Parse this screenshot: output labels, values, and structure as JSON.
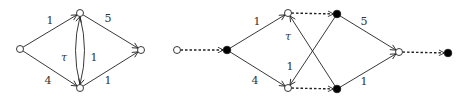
{
  "diagrams": [
    {
      "name": "left-graph",
      "nodes": [
        {
          "id": "s",
          "x": 20,
          "y": 49,
          "fill": "white"
        },
        {
          "id": "t",
          "x": 80,
          "y": 13,
          "fill": "white"
        },
        {
          "id": "b",
          "x": 80,
          "y": 88,
          "fill": "white"
        },
        {
          "id": "k",
          "x": 141,
          "y": 50,
          "fill": "white"
        }
      ],
      "edges": [
        {
          "from": "s",
          "to": "t",
          "label": "1",
          "lx": 50,
          "ly": 24
        },
        {
          "from": "s",
          "to": "b",
          "label": "4",
          "lx": 48,
          "ly": 84
        },
        {
          "from": "t",
          "to": "k",
          "label": "5",
          "lx": 108,
          "ly": 22
        },
        {
          "from": "b",
          "to": "k",
          "label": "1",
          "lx": 108,
          "ly": 84
        },
        {
          "from": "t",
          "to": "b",
          "label": "1",
          "lx": 94,
          "ly": 61,
          "curve": "right"
        },
        {
          "from": "b",
          "to": "t",
          "label": "τ",
          "lx": 64,
          "ly": 61,
          "curve": "left"
        }
      ]
    },
    {
      "name": "right-graph",
      "nodes": [
        {
          "id": "a",
          "x": 177,
          "y": 50,
          "fill": "white"
        },
        {
          "id": "c",
          "x": 227,
          "y": 50,
          "fill": "black"
        },
        {
          "id": "t",
          "x": 288,
          "y": 13,
          "fill": "white"
        },
        {
          "id": "b",
          "x": 288,
          "y": 88,
          "fill": "white"
        },
        {
          "id": "tb",
          "x": 337,
          "y": 14,
          "fill": "black"
        },
        {
          "id": "bb",
          "x": 337,
          "y": 89,
          "fill": "black"
        },
        {
          "id": "k",
          "x": 399,
          "y": 52,
          "fill": "white"
        },
        {
          "id": "e",
          "x": 448,
          "y": 53,
          "fill": "black"
        }
      ],
      "edges": [
        {
          "from": "a",
          "to": "c",
          "dashed": true
        },
        {
          "from": "c",
          "to": "t",
          "label": "1",
          "lx": 257,
          "ly": 25
        },
        {
          "from": "c",
          "to": "b",
          "label": "4",
          "lx": 255,
          "ly": 84
        },
        {
          "from": "t",
          "to": "tb",
          "dashed": true
        },
        {
          "from": "b",
          "to": "bb",
          "dashed": true
        },
        {
          "from": "bb",
          "to": "t",
          "label": "τ",
          "lx": 288,
          "ly": 40
        },
        {
          "from": "tb",
          "to": "b",
          "label": "1",
          "lx": 290,
          "ly": 70
        },
        {
          "from": "tb",
          "to": "k",
          "label": "5",
          "lx": 364,
          "ly": 25
        },
        {
          "from": "bb",
          "to": "k",
          "label": "1",
          "lx": 364,
          "ly": 85
        },
        {
          "from": "k",
          "to": "e",
          "dashed": true
        }
      ]
    }
  ]
}
